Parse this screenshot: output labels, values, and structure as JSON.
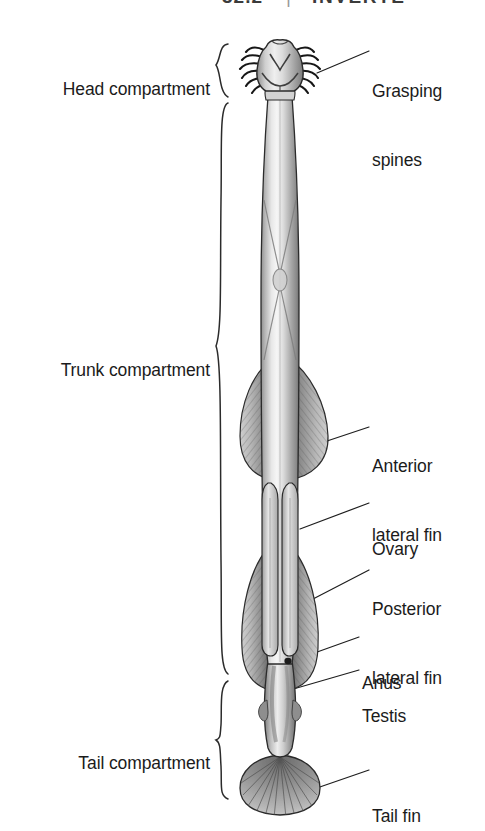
{
  "figure": {
    "page_header": {
      "section_number": "32.2",
      "divider": "|",
      "section_title": "INVERTE"
    },
    "colors": {
      "ink": "#1b1b1b",
      "body_light": "#f1f1f1",
      "body_mid": "#b9b9b9",
      "body_dark": "#6f6f6f",
      "fin_dark": "#5f5f5f",
      "fin_mid": "#9c9c9c",
      "outline": "#2a2a2a",
      "background": "#ffffff"
    },
    "compartment_labels": [
      {
        "id": "head",
        "text": "Head compartment",
        "x": 205,
        "y": 66
      },
      {
        "id": "trunk",
        "text": "Trunk compartment",
        "x": 205,
        "y": 347
      },
      {
        "id": "tail",
        "text": "Tail compartment",
        "x": 205,
        "y": 740
      }
    ],
    "part_labels": [
      {
        "id": "grasping-spines",
        "lines": [
          "Grasping",
          "spines"
        ],
        "x": 372,
        "y": 45
      },
      {
        "id": "anterior-lateral-fin",
        "lines": [
          "Anterior",
          "lateral fin"
        ],
        "x": 372,
        "y": 420
      },
      {
        "id": "ovary",
        "lines": [
          "Ovary"
        ],
        "x": 372,
        "y": 496
      },
      {
        "id": "posterior-lateral-fin",
        "lines": [
          "Posterior",
          "lateral fin"
        ],
        "x": 372,
        "y": 556
      },
      {
        "id": "anus",
        "lines": [
          "Anus"
        ],
        "x": 362,
        "y": 631
      },
      {
        "id": "testis",
        "lines": [
          "Testis"
        ],
        "x": 362,
        "y": 664
      },
      {
        "id": "tail-fin",
        "lines": [
          "Tail fin"
        ],
        "x": 372,
        "y": 763
      }
    ]
  }
}
